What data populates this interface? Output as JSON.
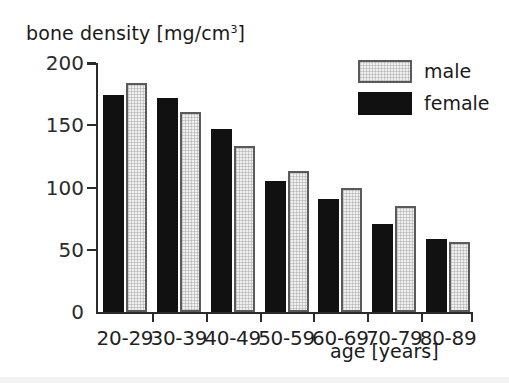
{
  "chart_data": {
    "type": "bar",
    "title": "",
    "categories": [
      "20-29",
      "30-39",
      "40-49",
      "50-59",
      "60-69",
      "70-79",
      "80-89"
    ],
    "series": [
      {
        "name": "female",
        "color": "#111111",
        "values": [
          174,
          172,
          147,
          105,
          91,
          71,
          59
        ]
      },
      {
        "name": "male",
        "color": "#efefef",
        "values": [
          184,
          161,
          133,
          113,
          100,
          85,
          56
        ]
      }
    ],
    "ylabel": "bone density [mg/cm3]",
    "ylabel_base": "bone density [mg/cm",
    "ylabel_exponent": "3",
    "ylabel_tail": "]",
    "xlabel": "age [years]",
    "ylim": [
      0,
      200
    ],
    "yticks": [
      0,
      50,
      100,
      150,
      200
    ],
    "ytick_labels": [
      "0",
      "50",
      "100",
      "150",
      "200"
    ],
    "grid": false,
    "legend_position": "top-right"
  },
  "legend": {
    "entries": [
      {
        "label": "male",
        "swatch": "male"
      },
      {
        "label": "female",
        "swatch": "female"
      }
    ]
  },
  "axes": {
    "y_title_base": "bone density [mg/cm",
    "y_title_sup": "3",
    "y_title_tail": "]",
    "x_title": "age [years]"
  }
}
